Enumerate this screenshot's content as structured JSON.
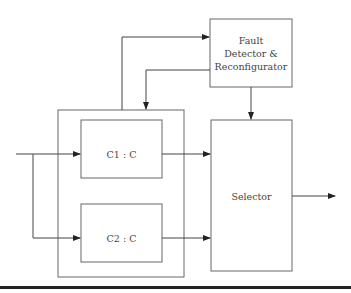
{
  "diagram": {
    "blocks": {
      "fault": {
        "lines": [
          "Fault",
          "Detector &",
          "Reconfigurator"
        ]
      },
      "c1": {
        "label": "C1 : C"
      },
      "c2": {
        "label": "C2 : C"
      },
      "selector": {
        "label": "Selector"
      }
    },
    "colors": {
      "stroke": "#555555",
      "text": "#444444",
      "rule": "#222222"
    }
  }
}
